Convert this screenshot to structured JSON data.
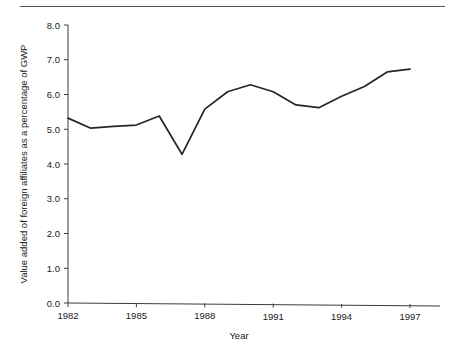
{
  "chart_data": {
    "type": "line",
    "title": "",
    "subtitle": "",
    "xlabel": "Year",
    "ylabel": "Value added of foreign affiliates as a percentage of GWP",
    "xlim": [
      1982,
      1997
    ],
    "ylim": [
      0.0,
      8.0
    ],
    "grid": false,
    "legend": null,
    "legend_position": "none",
    "x_tick_labels": [
      "1982",
      "1985",
      "1988",
      "1991",
      "1994",
      "1997"
    ],
    "x_ticks": [
      1982,
      1985,
      1988,
      1991,
      1994,
      1997
    ],
    "y_tick_labels": [
      "0.0",
      "1.0",
      "2.0",
      "3.0",
      "4.0",
      "5.0",
      "6.0",
      "7.0",
      "8.0"
    ],
    "y_ticks": [
      0.0,
      1.0,
      2.0,
      3.0,
      4.0,
      5.0,
      6.0,
      7.0,
      8.0
    ],
    "x": [
      1982,
      1983,
      1984,
      1985,
      1986,
      1987,
      1988,
      1989,
      1990,
      1991,
      1992,
      1993,
      1994,
      1995,
      1996,
      1997
    ],
    "values": [
      5.32,
      5.03,
      5.08,
      5.12,
      5.38,
      4.28,
      5.58,
      6.08,
      6.28,
      6.08,
      5.7,
      5.62,
      5.95,
      6.23,
      6.65,
      6.73
    ],
    "series": [
      {
        "name": "Value added of foreign affiliates as a percentage of GWP",
        "values": [
          5.32,
          5.03,
          5.08,
          5.12,
          5.38,
          4.28,
          5.58,
          6.08,
          6.28,
          6.08,
          5.7,
          5.62,
          5.95,
          6.23,
          6.65,
          6.73
        ]
      }
    ],
    "line_color": "#262626",
    "axis_color": "#3c3c3c",
    "background_color": "#ffffff"
  },
  "figure": {
    "has_top_rule": true,
    "top_rule_color": "#555555"
  }
}
